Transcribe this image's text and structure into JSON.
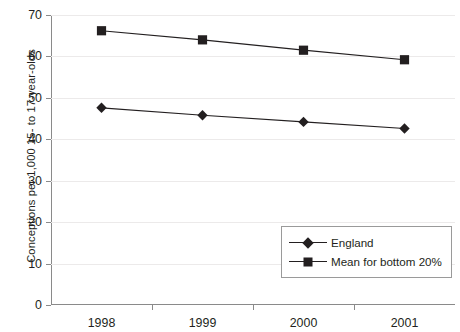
{
  "chart_data": {
    "type": "line",
    "title": "",
    "xlabel": "",
    "ylabel": "Conceptions per 1,000 15- to 17-year-olds",
    "categories": [
      "1998",
      "1999",
      "2000",
      "2001"
    ],
    "ylim": [
      0,
      70
    ],
    "yticks": [
      0,
      10,
      20,
      30,
      40,
      50,
      60,
      70
    ],
    "ytick_labels": [
      "0",
      "10",
      "20",
      "30",
      "40",
      "50",
      "60",
      "70"
    ],
    "grid": true,
    "legend_position": "inside-lower-right",
    "series": [
      {
        "name": "England",
        "marker": "diamond",
        "color": "#231f20",
        "values": [
          47.6,
          45.8,
          44.2,
          42.6
        ]
      },
      {
        "name": "Mean for bottom 20%",
        "marker": "square",
        "color": "#231f20",
        "values": [
          66.2,
          64.0,
          61.5,
          59.2
        ]
      }
    ]
  },
  "legend": {
    "items": [
      {
        "label": "England"
      },
      {
        "label": "Mean for bottom 20%"
      }
    ]
  }
}
